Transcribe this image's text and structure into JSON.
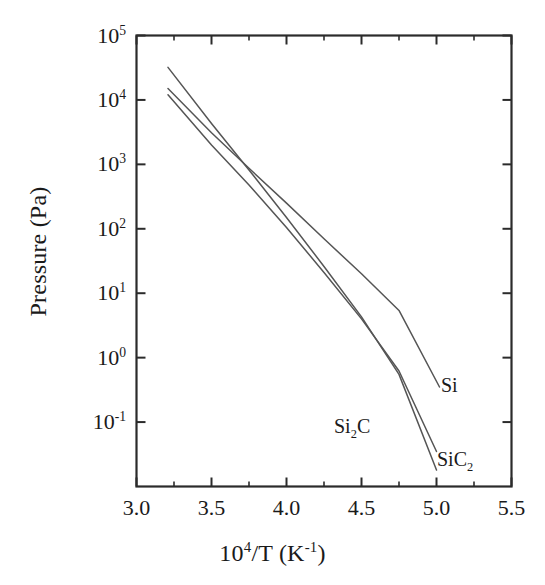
{
  "chart_data": {
    "type": "line",
    "title": "",
    "xlabel": "10^4/T (K^-1)",
    "ylabel": "Pressure (Pa)",
    "xlabel_parts": {
      "base": "10",
      "exp": "4",
      "mid": "/T (K",
      "exp2": "-1",
      "tail": ")"
    },
    "xlim": [
      3.0,
      5.5
    ],
    "ylim": [
      0.01,
      100000
    ],
    "yscale": "log",
    "xscale": "linear",
    "grid": false,
    "legend": "inline-labels",
    "xticks": [
      "3.0",
      "3.5",
      "4.0",
      "4.5",
      "5.0",
      "5.5"
    ],
    "xtick_values": [
      3.0,
      3.5,
      4.0,
      4.5,
      5.0,
      5.5
    ],
    "xminor_step": 0.25,
    "yticks": [
      "10^5",
      "10^4",
      "10^3",
      "10^2",
      "10^1",
      "10^0",
      "10^-1"
    ],
    "ytick_exponents": [
      5,
      4,
      3,
      2,
      1,
      0,
      -1
    ],
    "series": [
      {
        "name": "Si",
        "label": "Si",
        "color": "#555555",
        "x": [
          3.21,
          5.02
        ],
        "y": [
          15000.0,
          0.35
        ],
        "points": [
          [
            3.21,
            15000
          ],
          [
            3.5,
            3100
          ],
          [
            3.75,
            870
          ],
          [
            4.0,
            250
          ],
          [
            4.25,
            70
          ],
          [
            4.5,
            20
          ],
          [
            4.75,
            5.4
          ],
          [
            5.02,
            0.35
          ]
        ]
      },
      {
        "name": "Si2C",
        "label": "Si₂C",
        "color": "#555555",
        "x": [
          3.21,
          5.0
        ],
        "y": [
          32000.0,
          0.018
        ],
        "points": [
          [
            3.21,
            32000
          ],
          [
            3.5,
            4300
          ],
          [
            3.75,
            820
          ],
          [
            4.0,
            150
          ],
          [
            4.25,
            26
          ],
          [
            4.5,
            4.3
          ],
          [
            4.75,
            0.55
          ],
          [
            5.0,
            0.018
          ]
        ]
      },
      {
        "name": "SiC2",
        "label": "SiC₂",
        "color": "#555555",
        "x": [
          3.21,
          5.0
        ],
        "y": [
          12000.0,
          0.035
        ],
        "points": [
          [
            3.21,
            12000
          ],
          [
            3.5,
            2000
          ],
          [
            3.75,
            480
          ],
          [
            4.0,
            105
          ],
          [
            4.25,
            21
          ],
          [
            4.5,
            4.0
          ],
          [
            4.75,
            0.62
          ],
          [
            5.0,
            0.035
          ]
        ]
      }
    ],
    "annotations": [
      {
        "text": "Si",
        "x": 4.98,
        "y": 0.3,
        "anchor": "left"
      },
      {
        "text": "Si2C",
        "x": 4.27,
        "y": 0.055,
        "anchor": "left"
      },
      {
        "text": "SiC2",
        "x": 4.92,
        "y": 0.03,
        "anchor": "left"
      }
    ]
  },
  "labels": {
    "y_axis_title": "Pressure (Pa)",
    "series_si": "Si",
    "series_si2c_base": "Si",
    "series_si2c_sub": "2",
    "series_si2c_tail": "C",
    "series_sic2_base": "SiC",
    "series_sic2_sub": "2"
  },
  "colors": {
    "frame": "#2b2b2b",
    "curve": "#555555",
    "text": "#1a1a1a",
    "background": "#ffffff"
  }
}
